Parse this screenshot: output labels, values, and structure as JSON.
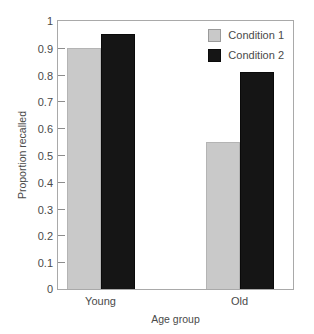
{
  "chart_data": {
    "type": "bar",
    "title": "",
    "subtitle": "",
    "xlabel": "Age group",
    "ylabel": "Proportion recalled",
    "categories": [
      "Young",
      "Old"
    ],
    "series": [
      {
        "name": "Condition 1",
        "values": [
          0.9,
          0.55
        ],
        "color": "#c9c9c9"
      },
      {
        "name": "Condition 2",
        "values": [
          0.95,
          0.81
        ],
        "color": "#151515"
      }
    ],
    "ylim": [
      0,
      1
    ],
    "ytick_values": [
      0,
      0.1,
      0.2,
      0.3,
      0.4,
      0.5,
      0.6,
      0.7,
      0.8,
      0.9,
      1
    ],
    "ytick_labels": [
      "0",
      "0.1",
      "0.2",
      "0.3",
      "0.4",
      "0.5",
      "0.6",
      "0.7",
      "0.8",
      "0.9",
      "1"
    ],
    "grid": false,
    "legend_position": "top-right",
    "legend_entries": [
      "Condition 1",
      "Condition 2"
    ],
    "annotations": []
  },
  "axes": {
    "y_title": "Proportion recalled",
    "x_title": "Age group",
    "frame_color": "#a9a9a9",
    "tick_color": "#8d8d8d",
    "text_color": "#4a4a4a",
    "background": "#ffffff"
  }
}
